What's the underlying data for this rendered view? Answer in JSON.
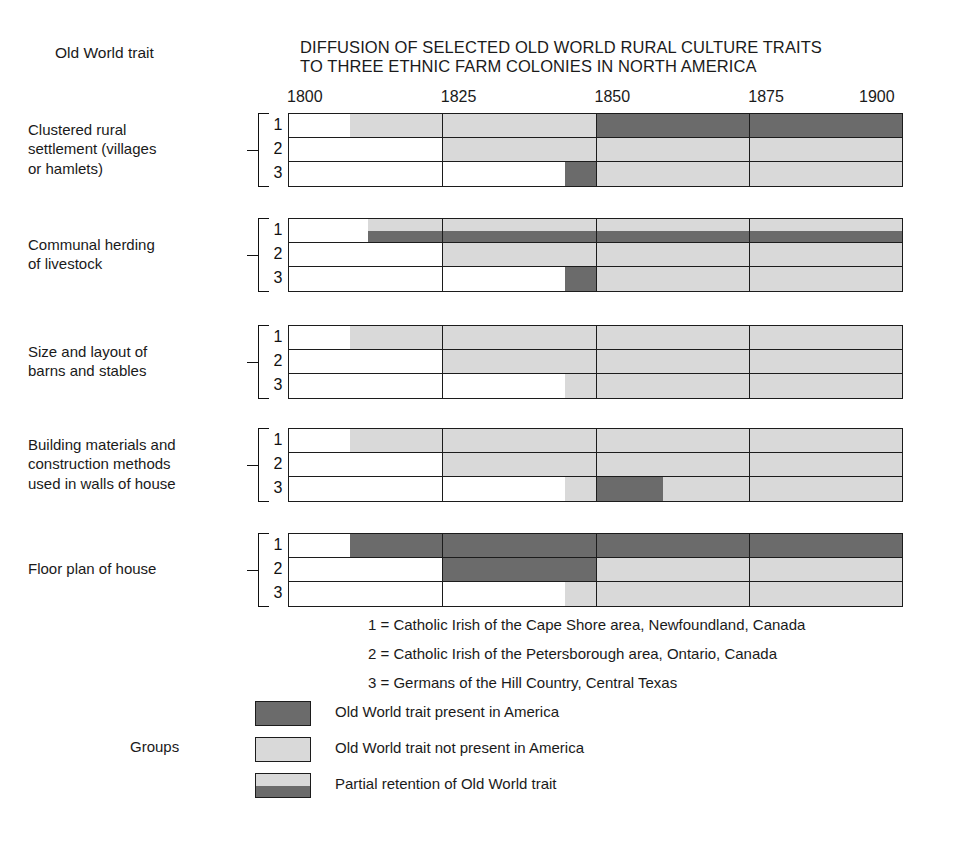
{
  "header": {
    "title": "DIFFUSION OF SELECTED OLD WORLD RURAL CULTURE TRAITS\nTO THREE ETHNIC FARM COLONIES IN NORTH AMERICA",
    "row_header": "Old World trait"
  },
  "legend_side_label": "Groups",
  "colors": {
    "present": "#6b6b6b",
    "absent": "#d9d9d9",
    "blank": "#ffffff",
    "outline": "#1c1c1c",
    "text": "#1a1a1a"
  },
  "group_key": [
    "1 = Catholic Irish of the Cape Shore area, Newfoundland, Canada",
    "2 = Catholic Irish of the Petersborough area, Ontario, Canada",
    "3 = Germans of the Hill Country, Central Texas"
  ],
  "legend": [
    {
      "swatch": "present",
      "label": "Old World trait present in America"
    },
    {
      "swatch": "absent",
      "label": "Old World trait not present in America"
    },
    {
      "swatch": "partial",
      "label": "Partial retention of Old World trait"
    }
  ],
  "chart_data": {
    "type": "timeline-matrix",
    "title": "DIFFUSION OF SELECTED OLD WORLD RURAL CULTURE TRAITS TO THREE ETHNIC FARM COLONIES IN NORTH AMERICA",
    "xlabel": "",
    "ylabel": "Old World trait",
    "xlim": [
      1800,
      1900
    ],
    "ticks": [
      1800,
      1825,
      1850,
      1875,
      1900
    ],
    "tick_labels": [
      "1800",
      "1825",
      "1850",
      "1875",
      "1900"
    ],
    "gridlines": [
      1825,
      1850,
      1875
    ],
    "grid": true,
    "legend_position": "bottom",
    "state_values": [
      "blank",
      "present",
      "absent",
      "partial"
    ],
    "row_numbers": [
      "1",
      "2",
      "3"
    ],
    "groups": [
      {
        "label": "Clustered rural\nsettlement (villages\nor hamlets)",
        "rows": [
          {
            "number": "1",
            "segments": [
              {
                "from": 1800,
                "to": 1810,
                "state": "blank"
              },
              {
                "from": 1810,
                "to": 1850,
                "state": "absent"
              },
              {
                "from": 1850,
                "to": 1900,
                "state": "present"
              }
            ]
          },
          {
            "number": "2",
            "segments": [
              {
                "from": 1800,
                "to": 1825,
                "state": "blank"
              },
              {
                "from": 1825,
                "to": 1900,
                "state": "absent"
              }
            ]
          },
          {
            "number": "3",
            "segments": [
              {
                "from": 1800,
                "to": 1845,
                "state": "blank"
              },
              {
                "from": 1845,
                "to": 1850,
                "state": "present"
              },
              {
                "from": 1850,
                "to": 1900,
                "state": "absent"
              }
            ]
          }
        ]
      },
      {
        "label": "Communal herding\nof livestock",
        "rows": [
          {
            "number": "1",
            "segments": [
              {
                "from": 1800,
                "to": 1813,
                "state": "blank"
              },
              {
                "from": 1813,
                "to": 1900,
                "state": "partial"
              }
            ]
          },
          {
            "number": "2",
            "segments": [
              {
                "from": 1800,
                "to": 1825,
                "state": "blank"
              },
              {
                "from": 1825,
                "to": 1900,
                "state": "absent"
              }
            ]
          },
          {
            "number": "3",
            "segments": [
              {
                "from": 1800,
                "to": 1845,
                "state": "blank"
              },
              {
                "from": 1845,
                "to": 1850,
                "state": "present"
              },
              {
                "from": 1850,
                "to": 1900,
                "state": "absent"
              }
            ]
          }
        ]
      },
      {
        "label": "Size and layout of\nbarns and stables",
        "rows": [
          {
            "number": "1",
            "segments": [
              {
                "from": 1800,
                "to": 1810,
                "state": "blank"
              },
              {
                "from": 1810,
                "to": 1900,
                "state": "absent"
              }
            ]
          },
          {
            "number": "2",
            "segments": [
              {
                "from": 1800,
                "to": 1825,
                "state": "blank"
              },
              {
                "from": 1825,
                "to": 1900,
                "state": "absent"
              }
            ]
          },
          {
            "number": "3",
            "segments": [
              {
                "from": 1800,
                "to": 1845,
                "state": "blank"
              },
              {
                "from": 1845,
                "to": 1900,
                "state": "absent"
              }
            ]
          }
        ]
      },
      {
        "label": "Building materials and\nconstruction methods\nused in walls of house",
        "rows": [
          {
            "number": "1",
            "segments": [
              {
                "from": 1800,
                "to": 1810,
                "state": "blank"
              },
              {
                "from": 1810,
                "to": 1900,
                "state": "absent"
              }
            ]
          },
          {
            "number": "2",
            "segments": [
              {
                "from": 1800,
                "to": 1825,
                "state": "blank"
              },
              {
                "from": 1825,
                "to": 1900,
                "state": "absent"
              }
            ]
          },
          {
            "number": "3",
            "segments": [
              {
                "from": 1800,
                "to": 1845,
                "state": "blank"
              },
              {
                "from": 1845,
                "to": 1850,
                "state": "absent"
              },
              {
                "from": 1850,
                "to": 1861,
                "state": "present"
              },
              {
                "from": 1861,
                "to": 1900,
                "state": "absent"
              }
            ]
          }
        ]
      },
      {
        "label": "Floor plan of house",
        "rows": [
          {
            "number": "1",
            "segments": [
              {
                "from": 1800,
                "to": 1810,
                "state": "blank"
              },
              {
                "from": 1810,
                "to": 1900,
                "state": "present"
              }
            ]
          },
          {
            "number": "2",
            "segments": [
              {
                "from": 1800,
                "to": 1825,
                "state": "blank"
              },
              {
                "from": 1825,
                "to": 1850,
                "state": "present"
              },
              {
                "from": 1850,
                "to": 1900,
                "state": "absent"
              }
            ]
          },
          {
            "number": "3",
            "segments": [
              {
                "from": 1800,
                "to": 1845,
                "state": "blank"
              },
              {
                "from": 1845,
                "to": 1900,
                "state": "absent"
              }
            ]
          }
        ]
      }
    ]
  }
}
